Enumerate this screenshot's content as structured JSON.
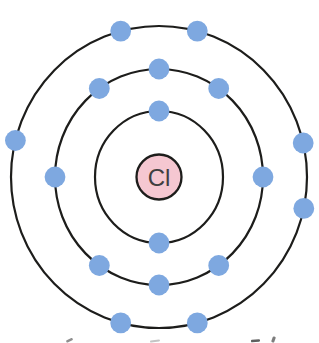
{
  "diagram": {
    "element_symbol": "Cl",
    "background": "#ffffff",
    "center": {
      "x": 159,
      "y": 177
    },
    "shell_stroke": "#1d1d1b",
    "shell_stroke_width": 2.2,
    "nucleus": {
      "label": "Cl",
      "radius": 22.5,
      "fill": "#f5c7d1",
      "stroke": "#1d1d1b",
      "stroke_width": 2.3,
      "label_color": "#3f3f3f",
      "label_size": 24
    },
    "electron": {
      "radius": 10.4,
      "fill": "#7ea8e0"
    },
    "shells": [
      {
        "name": "shell-1",
        "rx": 64,
        "ry": 66,
        "electron_count": 2,
        "electron_angles_deg": [
          -90,
          90
        ]
      },
      {
        "name": "shell-2",
        "rx": 104,
        "ry": 108,
        "electron_count": 8,
        "electron_angles_deg": [
          -125,
          -90,
          -55,
          0,
          55,
          90,
          125,
          180
        ]
      },
      {
        "name": "shell-3",
        "rx": 148,
        "ry": 151,
        "electron_count": 7,
        "electron_angles_deg": [
          -166,
          -105,
          -75,
          -13,
          12,
          75,
          105
        ]
      }
    ],
    "electrons_total": 17,
    "edge_marks": [
      {
        "x": 66,
        "y": 339,
        "width": 7,
        "height": 2.5,
        "rotation": -25,
        "color": "#8f8f8f"
      },
      {
        "x": 150,
        "y": 340,
        "width": 10,
        "height": 2,
        "rotation": -8,
        "color": "#c4c4c4"
      },
      {
        "x": 251,
        "y": 339.5,
        "width": 9,
        "height": 2.5,
        "rotation": -5,
        "color": "#5f5f5f"
      },
      {
        "x": 272,
        "y": 336.5,
        "width": 3,
        "height": 6,
        "rotation": 20,
        "color": "#7d7d7d"
      }
    ]
  }
}
